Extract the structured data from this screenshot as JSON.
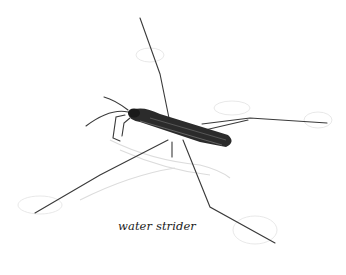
{
  "illustration": {
    "subject": "water strider",
    "caption": "water strider",
    "background_color": "#ffffff",
    "insect_color": "#2b2b2b",
    "shadow_color": "#d8d8d8"
  }
}
